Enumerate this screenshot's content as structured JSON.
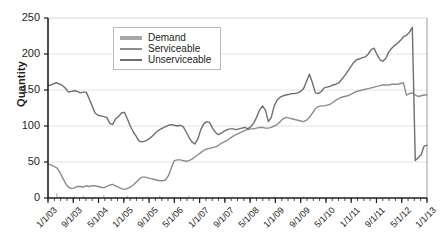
{
  "chart_data": {
    "type": "line",
    "title": "",
    "xlabel": "",
    "ylabel": "Quantity",
    "ylim": [
      0,
      250
    ],
    "yticks": [
      0,
      50,
      100,
      150,
      200,
      250
    ],
    "grid": true,
    "legend_position": "top-center",
    "xtick_labels": [
      "1/1/03",
      "9/1/03",
      "5/1/04",
      "1/1/05",
      "9/1/05",
      "5/1/06",
      "1/1/07",
      "9/1/07",
      "5/1/08",
      "1/1/09",
      "9/1/09",
      "5/1/10",
      "1/1/11",
      "9/1/11",
      "5/1/12",
      "1/1/13"
    ],
    "x_start": "1/1/03",
    "x_end": "5/1/13",
    "x_step_months": 1,
    "colors": {
      "demand": "#a8a8a8",
      "serviceable": "#8c8c8c",
      "unserviceable": "#6e6e6e",
      "grid": "#e4e4e4",
      "axis": "#231f20"
    },
    "series": [
      {
        "name": "Demand",
        "values": [
          3,
          1,
          0,
          7,
          2,
          1,
          0,
          1,
          0,
          2,
          0,
          1,
          3,
          0,
          1,
          0,
          2,
          0,
          1,
          4,
          0,
          1,
          0,
          2,
          0,
          1,
          0,
          3,
          0,
          1,
          2,
          0,
          1,
          0,
          2,
          0,
          1,
          0,
          3,
          1,
          0,
          1,
          0,
          2,
          0,
          1,
          0,
          1,
          3,
          0,
          1,
          0,
          2,
          0,
          1,
          0,
          1,
          0,
          2,
          0,
          1,
          0,
          1,
          2,
          0,
          1,
          0,
          1,
          0,
          2,
          0,
          1,
          0,
          1,
          0,
          1,
          0,
          2,
          0,
          1,
          0,
          1,
          0,
          1,
          0,
          1,
          0,
          2,
          0,
          1,
          0,
          1,
          0,
          1,
          0,
          1,
          0,
          1,
          0,
          1,
          0,
          1,
          0,
          1,
          0,
          1,
          0,
          1,
          0,
          1,
          0,
          1,
          0,
          1,
          0,
          1,
          0,
          1,
          0,
          1,
          0,
          1,
          0,
          1
        ]
      },
      {
        "name": "Serviceable",
        "values": [
          47,
          46,
          44,
          42,
          36,
          28,
          20,
          15,
          13,
          14,
          16,
          16,
          15,
          17,
          16,
          17,
          17,
          16,
          15,
          14,
          16,
          18,
          19,
          17,
          15,
          13,
          12,
          13,
          15,
          18,
          22,
          26,
          29,
          29,
          28,
          27,
          26,
          25,
          24,
          24,
          25,
          31,
          42,
          52,
          53,
          53,
          52,
          51,
          52,
          54,
          57,
          60,
          63,
          66,
          68,
          69,
          70,
          71,
          73,
          76,
          78,
          80,
          83,
          86,
          88,
          90,
          92,
          94,
          95,
          96,
          96,
          97,
          98,
          98,
          97,
          97,
          98,
          100,
          102,
          106,
          110,
          112,
          111,
          110,
          109,
          108,
          107,
          106,
          108,
          112,
          118,
          124,
          127,
          128,
          128,
          129,
          130,
          133,
          136,
          138,
          140,
          141,
          142,
          144,
          146,
          148,
          149,
          150,
          151,
          152,
          153,
          154,
          155,
          156,
          157,
          157,
          157,
          158,
          158,
          158,
          159,
          160,
          143,
          145,
          146,
          143,
          141,
          142,
          143,
          143
        ]
      },
      {
        "name": "Unserviceable",
        "values": [
          156,
          157,
          159,
          160,
          158,
          156,
          152,
          147,
          148,
          149,
          148,
          146,
          147,
          147,
          138,
          128,
          118,
          115,
          114,
          113,
          112,
          104,
          102,
          110,
          113,
          118,
          119,
          110,
          100,
          92,
          86,
          79,
          78,
          79,
          81,
          84,
          88,
          92,
          95,
          97,
          99,
          101,
          102,
          101,
          100,
          101,
          99,
          92,
          84,
          78,
          75,
          82,
          95,
          103,
          106,
          105,
          97,
          91,
          88,
          90,
          93,
          95,
          96,
          96,
          95,
          96,
          97,
          98,
          96,
          99,
          104,
          112,
          122,
          128,
          122,
          106,
          112,
          128,
          136,
          140,
          142,
          143,
          144,
          145,
          145,
          146,
          148,
          152,
          162,
          172,
          160,
          146,
          145,
          148,
          153,
          154,
          155,
          157,
          158,
          160,
          165,
          170,
          176,
          182,
          188,
          192,
          193,
          195,
          196,
          200,
          206,
          208,
          199,
          192,
          190,
          194,
          203,
          208,
          212,
          215,
          219,
          224,
          226,
          230,
          237,
          52,
          56,
          60,
          72,
          73
        ]
      }
    ]
  },
  "legend": {
    "items": [
      {
        "label": "Demand"
      },
      {
        "label": "Serviceable"
      },
      {
        "label": "Unserviceable"
      }
    ]
  }
}
